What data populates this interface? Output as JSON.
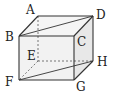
{
  "diagram": {
    "type": "cube",
    "vertices": {
      "A": [
        38,
        16
      ],
      "D": [
        93,
        16
      ],
      "B": [
        19,
        36
      ],
      "C": [
        74,
        36
      ],
      "E": [
        38,
        61
      ],
      "H": [
        93,
        61
      ],
      "F": [
        19,
        80
      ],
      "G": [
        74,
        80
      ]
    },
    "labels": [
      {
        "id": "A",
        "text": "A",
        "x": 26,
        "y": 14
      },
      {
        "id": "B",
        "text": "B",
        "x": 5,
        "y": 41
      },
      {
        "id": "C",
        "text": "C",
        "x": 77,
        "y": 46
      },
      {
        "id": "D",
        "text": "D",
        "x": 96,
        "y": 19
      },
      {
        "id": "E",
        "text": "E",
        "x": 27,
        "y": 60
      },
      {
        "id": "F",
        "text": "F",
        "x": 5,
        "y": 86
      },
      {
        "id": "G",
        "text": "G",
        "x": 76,
        "y": 91
      },
      {
        "id": "H",
        "text": "H",
        "x": 97,
        "y": 66
      }
    ],
    "visible_edges": [
      "AB",
      "AD",
      "BC",
      "CD",
      "BF",
      "CG",
      "DH",
      "FG",
      "GH"
    ],
    "hidden_edges": [
      "AE",
      "EF",
      "EH"
    ],
    "diagonals": [
      "BD",
      "FH"
    ],
    "colors": {
      "edge": "#333333",
      "face_front": "#f2f2f2",
      "face_top": "#f5f5f5",
      "face_side": "#e8e8e8"
    }
  }
}
